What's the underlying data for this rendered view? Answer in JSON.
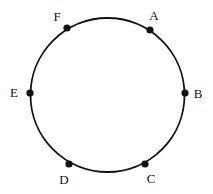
{
  "diagram": {
    "circle": {
      "cx": 107.5,
      "cy": 95,
      "r": 77,
      "stroke": "#111111"
    },
    "points": [
      {
        "label": "A",
        "x": 150,
        "y": 30,
        "lx": 154,
        "ly": 20
      },
      {
        "label": "B",
        "x": 185,
        "y": 93,
        "lx": 198,
        "ly": 98
      },
      {
        "label": "C",
        "x": 145,
        "y": 164,
        "lx": 151,
        "ly": 183
      },
      {
        "label": "D",
        "x": 69,
        "y": 164,
        "lx": 64,
        "ly": 184
      },
      {
        "label": "E",
        "x": 30,
        "y": 93,
        "lx": 14,
        "ly": 97
      },
      {
        "label": "F",
        "x": 67,
        "y": 28,
        "lx": 57,
        "ly": 21
      }
    ]
  }
}
